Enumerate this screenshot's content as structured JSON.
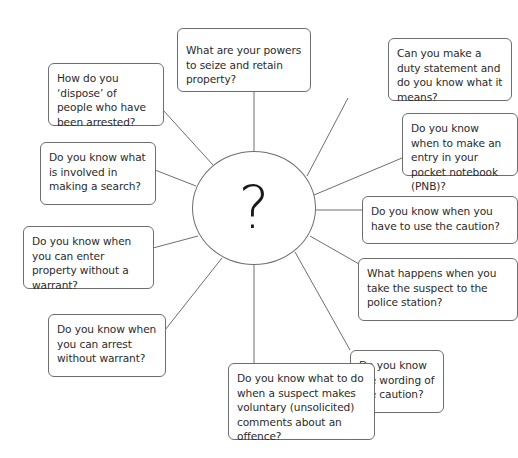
{
  "diagram": {
    "type": "spider-diagram",
    "center": {
      "label": "?"
    },
    "nodes": [
      {
        "id": "seize",
        "text": "What are your powers to seize and retain property?"
      },
      {
        "id": "duty",
        "text": "Can you make a duty statement and do you know what it means?"
      },
      {
        "id": "pnb",
        "text": "Do you know when to make an entry in your pocket notebook (PNB)?"
      },
      {
        "id": "caution-use",
        "text": "Do you know when you have to use the caution?"
      },
      {
        "id": "police-station",
        "text": "What happens when you take the suspect to the police station?"
      },
      {
        "id": "caution-wording",
        "text": "Do you know the wording of the caution?"
      },
      {
        "id": "voluntary-comments",
        "text": "Do you know what to do when a suspect makes voluntary (unsolicited) comments about an offence?"
      },
      {
        "id": "arrest",
        "text": "Do you know when you can arrest without warrant?"
      },
      {
        "id": "enter-property",
        "text": "Do you know when you can enter property without a warrant?"
      },
      {
        "id": "search",
        "text": "Do you know what is involved in making a search?"
      },
      {
        "id": "dispose",
        "text": "How do you ‘dispose’ of people who have been arrested?"
      }
    ]
  },
  "colors": {
    "stroke": "#6e6e6e",
    "text": "#2b2b2b",
    "background": "#ffffff"
  }
}
